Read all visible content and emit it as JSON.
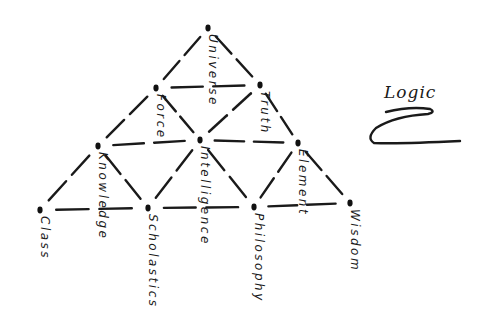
{
  "diagram": {
    "title": "Logic",
    "type": "triangular concept lattice (hand-drawn)",
    "nodes": [
      {
        "id": "universe",
        "label": "Universe",
        "x": 208,
        "y": 28
      },
      {
        "id": "force",
        "label": "Force",
        "x": 156,
        "y": 88
      },
      {
        "id": "truth",
        "label": "Truth",
        "x": 260,
        "y": 85
      },
      {
        "id": "knowledge",
        "label": "Knowledge",
        "x": 98,
        "y": 146
      },
      {
        "id": "intelligence",
        "label": "Intelligence",
        "x": 200,
        "y": 140
      },
      {
        "id": "element",
        "label": "Element",
        "x": 298,
        "y": 143
      },
      {
        "id": "class",
        "label": "Class",
        "x": 40,
        "y": 210
      },
      {
        "id": "scholastics",
        "label": "Scholastics",
        "x": 148,
        "y": 208
      },
      {
        "id": "philosophy",
        "label": "Philosophy",
        "x": 254,
        "y": 207
      },
      {
        "id": "wisdom",
        "label": "Wisdom",
        "x": 350,
        "y": 203
      }
    ],
    "edges": [
      [
        "universe",
        "force"
      ],
      [
        "universe",
        "truth"
      ],
      [
        "force",
        "truth"
      ],
      [
        "force",
        "knowledge"
      ],
      [
        "force",
        "intelligence"
      ],
      [
        "truth",
        "intelligence"
      ],
      [
        "truth",
        "element"
      ],
      [
        "knowledge",
        "intelligence"
      ],
      [
        "intelligence",
        "element"
      ],
      [
        "knowledge",
        "class"
      ],
      [
        "knowledge",
        "scholastics"
      ],
      [
        "intelligence",
        "scholastics"
      ],
      [
        "intelligence",
        "philosophy"
      ],
      [
        "element",
        "philosophy"
      ],
      [
        "element",
        "wisdom"
      ],
      [
        "class",
        "scholastics"
      ],
      [
        "scholastics",
        "philosophy"
      ],
      [
        "philosophy",
        "wisdom"
      ]
    ]
  }
}
